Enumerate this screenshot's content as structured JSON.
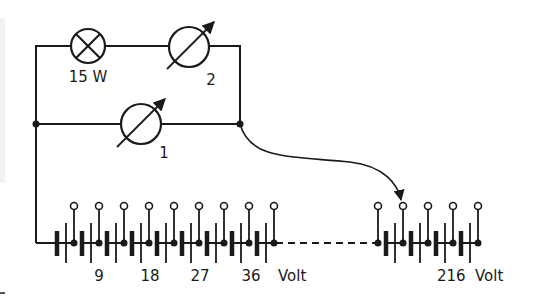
{
  "diagram": {
    "title": "",
    "colors": {
      "ink": "#1a1a1a",
      "background": "#ffffff"
    },
    "lamp": {
      "label": "15 W",
      "icon": "lamp-icon"
    },
    "meter_top": {
      "label": "2",
      "icon": "variable-meter-icon"
    },
    "meter_mid": {
      "label": "1",
      "icon": "variable-meter-icon"
    },
    "battery_left": {
      "tap_count": 9,
      "voltage_labels": [
        "9",
        "18",
        "27",
        "36"
      ],
      "unit": "Volt"
    },
    "battery_right": {
      "tap_count": 5,
      "voltage_label": "216",
      "unit": "Volt"
    },
    "connector": {
      "description": "curved arrow from right junction to selectable tap",
      "icon": "curved-arrow-icon"
    }
  }
}
